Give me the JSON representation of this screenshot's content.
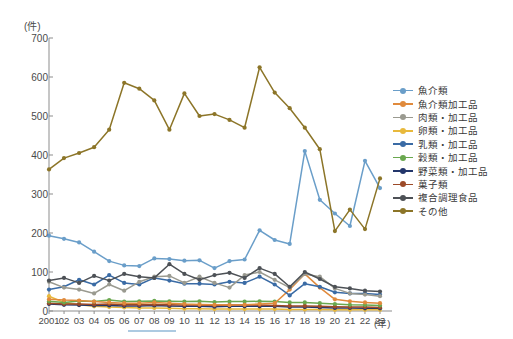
{
  "axis": {
    "y_unit": "(件)",
    "x_unit": "(年)",
    "y_ticks": [
      "0",
      "100",
      "200",
      "300",
      "400",
      "500",
      "600",
      "700"
    ],
    "x_ticks": [
      "2001",
      "02",
      "03",
      "04",
      "05",
      "06",
      "07",
      "08",
      "09",
      "10",
      "11",
      "12",
      "13",
      "14",
      "15",
      "16",
      "17",
      "18",
      "19",
      "20",
      "21",
      "22",
      "23"
    ]
  },
  "legend": {
    "items": [
      {
        "label": "魚介類",
        "color": "#6a9ec9"
      },
      {
        "label": "魚介類加工品",
        "color": "#e08a3c"
      },
      {
        "label": "肉類・加工品",
        "color": "#9a9a90"
      },
      {
        "label": "卵類・加工品",
        "color": "#e8b93c"
      },
      {
        "label": "乳類・加工品",
        "color": "#3a6ba5"
      },
      {
        "label": "穀類・加工品",
        "color": "#6aa84f"
      },
      {
        "label": "野菜類・加工品",
        "color": "#23366b"
      },
      {
        "label": "菓子類",
        "color": "#9c4a28"
      },
      {
        "label": "複合調理食品",
        "color": "#4d5156"
      },
      {
        "label": "その他",
        "color": "#8c7528"
      }
    ]
  },
  "chart_data": {
    "type": "line",
    "title": "",
    "xlabel": "(年)",
    "ylabel": "(件)",
    "ylim": [
      0,
      700
    ],
    "ytick_step": 100,
    "grid": false,
    "legend_position": "right",
    "x": [
      "2001",
      "02",
      "03",
      "04",
      "05",
      "06",
      "07",
      "08",
      "09",
      "10",
      "11",
      "12",
      "13",
      "14",
      "15",
      "16",
      "17",
      "18",
      "19",
      "20",
      "21",
      "22",
      "23"
    ],
    "series": [
      {
        "name": "魚介類",
        "color": "#6a9ec9",
        "values": [
          193,
          185,
          176,
          152,
          128,
          117,
          115,
          135,
          133,
          129,
          130,
          110,
          128,
          132,
          207,
          182,
          172,
          410,
          285,
          250,
          218,
          385,
          315
        ]
      },
      {
        "name": "魚介類加工品",
        "color": "#e08a3c",
        "values": [
          30,
          28,
          27,
          24,
          22,
          20,
          20,
          22,
          20,
          18,
          17,
          16,
          15,
          16,
          18,
          20,
          55,
          95,
          60,
          30,
          25,
          22,
          20
        ]
      },
      {
        "name": "肉類・加工品",
        "color": "#9a9a90",
        "values": [
          75,
          60,
          55,
          45,
          68,
          52,
          75,
          88,
          90,
          72,
          88,
          72,
          60,
          92,
          100,
          80,
          60,
          95,
          88,
          58,
          45,
          42,
          38
        ]
      },
      {
        "name": "卵類・加工品",
        "color": "#e8b93c",
        "values": [
          38,
          22,
          16,
          12,
          10,
          9,
          8,
          8,
          7,
          6,
          6,
          5,
          5,
          5,
          5,
          5,
          4,
          4,
          4,
          3,
          3,
          3,
          3
        ]
      },
      {
        "name": "乳類・加工品",
        "color": "#3a6ba5",
        "values": [
          55,
          62,
          80,
          68,
          92,
          72,
          68,
          85,
          78,
          70,
          70,
          68,
          75,
          72,
          88,
          68,
          40,
          70,
          62,
          48,
          45,
          45,
          42
        ]
      },
      {
        "name": "穀類・加工品",
        "color": "#6aa84f",
        "values": [
          25,
          22,
          26,
          24,
          28,
          24,
          25,
          26,
          25,
          24,
          25,
          23,
          24,
          24,
          25,
          24,
          22,
          22,
          20,
          18,
          16,
          15,
          14
        ]
      },
      {
        "name": "野菜類・加工品",
        "color": "#23366b",
        "values": [
          18,
          16,
          15,
          14,
          14,
          13,
          13,
          14,
          13,
          12,
          12,
          11,
          12,
          12,
          12,
          12,
          10,
          10,
          9,
          8,
          8,
          7,
          7
        ]
      },
      {
        "name": "菓子類",
        "color": "#9c4a28",
        "values": [
          20,
          18,
          18,
          17,
          18,
          16,
          16,
          17,
          16,
          15,
          15,
          14,
          15,
          15,
          15,
          14,
          13,
          13,
          12,
          11,
          10,
          10,
          9
        ]
      },
      {
        "name": "複合調理食品",
        "color": "#4d5156",
        "values": [
          78,
          85,
          72,
          90,
          78,
          95,
          88,
          85,
          120,
          95,
          80,
          92,
          98,
          85,
          110,
          95,
          62,
          100,
          82,
          62,
          58,
          52,
          50
        ]
      },
      {
        "name": "その他",
        "color": "#8c7528",
        "values": [
          363,
          392,
          405,
          420,
          465,
          585,
          570,
          540,
          465,
          558,
          500,
          505,
          490,
          470,
          625,
          560,
          520,
          470,
          415,
          205,
          260,
          210,
          340
        ]
      }
    ]
  }
}
